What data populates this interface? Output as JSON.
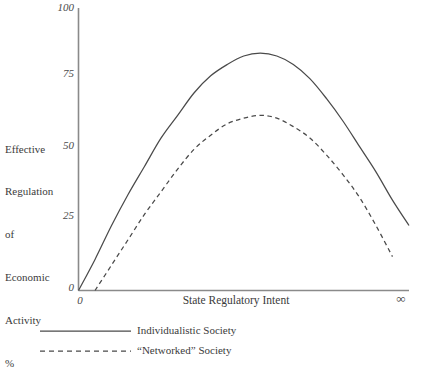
{
  "chart_data": {
    "type": "line",
    "title": "",
    "xlabel": "State Regulatory Intent",
    "ylabel": "Effective Regulation of Economic Activity %",
    "ylabel_lines": [
      "Effective",
      "Regulation",
      "of",
      "Economic",
      "Activity",
      "%"
    ],
    "xlim": [
      0,
      100
    ],
    "ylim": [
      0,
      100
    ],
    "x_tick_labels": [
      "0",
      "∞"
    ],
    "y_tick_labels": [
      "0",
      "25",
      "50",
      "75",
      "100"
    ],
    "y_ticks": [
      0,
      25,
      50,
      75,
      100
    ],
    "grid": false,
    "legend_position": "below-axes-left",
    "axis_color": "#8a8a8a",
    "line_color": "#4a4a4a",
    "series": [
      {
        "name": "Individualistic Society",
        "style": "solid",
        "x": [
          0,
          5,
          10,
          15,
          20,
          25,
          30,
          35,
          40,
          45,
          50,
          55,
          60,
          65,
          70,
          75,
          80,
          85,
          90,
          95,
          100
        ],
        "values": [
          0,
          11,
          23,
          34,
          44,
          54,
          62,
          70,
          76,
          80,
          83,
          84,
          83,
          80,
          75,
          68,
          60,
          51,
          42,
          32,
          23
        ]
      },
      {
        "name": "“Networked” Society",
        "style": "dashed",
        "x": [
          5,
          10,
          15,
          20,
          25,
          30,
          35,
          40,
          45,
          50,
          55,
          60,
          65,
          70,
          75,
          80,
          85,
          90,
          95
        ],
        "values": [
          0,
          9,
          18,
          27,
          35,
          43,
          50,
          55,
          59,
          61,
          62,
          61,
          58,
          54,
          48,
          41,
          33,
          23,
          12
        ]
      }
    ],
    "legend_entries": [
      {
        "label": "Individualistic Society",
        "style": "solid"
      },
      {
        "label": "“Networked” Society",
        "style": "dashed"
      }
    ]
  }
}
